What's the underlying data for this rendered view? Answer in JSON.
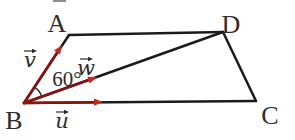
{
  "figure": {
    "background": "#ffffff",
    "stroke_color": "#1b1b1b",
    "vector_shaft_color": "#8a1310",
    "vector_arrow_color": "#c02b1e",
    "label_color": "#2d2d2d",
    "vertices": [
      {
        "id": "A",
        "label": "A",
        "x": 69,
        "y": 35,
        "lx": 57,
        "ly": 32
      },
      {
        "id": "B",
        "label": "B",
        "x": 24,
        "y": 103,
        "lx": 14,
        "ly": 129
      },
      {
        "id": "C",
        "label": "C",
        "x": 256,
        "y": 101,
        "lx": 270,
        "ly": 124
      },
      {
        "id": "D",
        "label": "D",
        "x": 223,
        "y": 32,
        "lx": 231,
        "ly": 33
      }
    ],
    "edges": [
      [
        "B",
        "A"
      ],
      [
        "A",
        "D"
      ],
      [
        "D",
        "C"
      ],
      [
        "C",
        "B"
      ],
      [
        "B",
        "D"
      ]
    ],
    "vectors": [
      {
        "label": "v",
        "from": "B",
        "tip": [
          62,
          45
        ],
        "lx": 30,
        "ly": 67
      },
      {
        "label": "w",
        "from": "B",
        "tip": [
          97,
          77
        ],
        "lx": 86,
        "ly": 75
      },
      {
        "label": "u",
        "from": "B",
        "tip": [
          103,
          102
        ],
        "lx": 62,
        "ly": 128
      }
    ],
    "angle": {
      "label": "60°",
      "vertex": "B",
      "between": [
        "A",
        "D"
      ],
      "radius": 19,
      "lx": 67,
      "ly": 86
    },
    "artifact": {
      "x": 53,
      "y": 0,
      "width": 13,
      "height": 2,
      "color": "#8d8d8d"
    }
  }
}
